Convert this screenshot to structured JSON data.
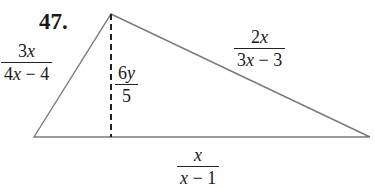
{
  "problem": {
    "number": "47."
  },
  "triangle": {
    "vertices": {
      "left": [
        34,
        137
      ],
      "apex": [
        111,
        14
      ],
      "right": [
        370,
        137
      ]
    },
    "height_foot": [
      111,
      137
    ],
    "stroke_color": "#7a7a7a",
    "height_line_color": "#222222"
  },
  "labels": {
    "left_side": {
      "numerator": "3x",
      "denominator": "4x − 4"
    },
    "right_side": {
      "numerator": "2x",
      "denominator": "3x − 3"
    },
    "height": {
      "numerator": "6y",
      "denominator": "5"
    },
    "base": {
      "numerator": "x",
      "denominator": "x − 1"
    }
  }
}
